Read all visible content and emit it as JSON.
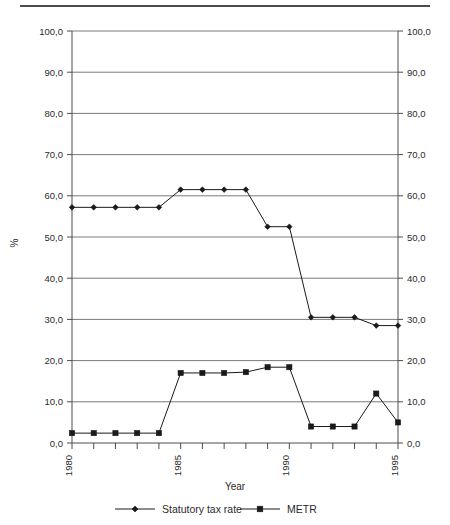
{
  "chart_data": {
    "type": "line",
    "title": "",
    "xlabel": "Year",
    "ylabel": "%",
    "x": [
      1980,
      1981,
      1982,
      1983,
      1984,
      1985,
      1986,
      1987,
      1988,
      1989,
      1990,
      1991,
      1992,
      1993,
      1994,
      1995
    ],
    "xlim": [
      1980,
      1995
    ],
    "ylim": [
      0,
      100
    ],
    "y_ticks": [
      0,
      10,
      20,
      30,
      40,
      50,
      60,
      70,
      80,
      90,
      100
    ],
    "y_tick_labels": [
      "0,0",
      "10,0",
      "20,0",
      "30,0",
      "40,0",
      "50,0",
      "60,0",
      "70,0",
      "80,0",
      "90,0",
      "100,0"
    ],
    "x_tick_labels_shown": [
      "1980",
      "1985",
      "1990",
      "1995"
    ],
    "x_tick_values_shown": [
      1980,
      1985,
      1990,
      1995
    ],
    "grid": "horizontal",
    "dual_y_axis": true,
    "right_axis_tick_labels": [
      "0,0",
      "10,0",
      "20,0",
      "30,0",
      "40,0",
      "50,0",
      "60,0",
      "70,0",
      "80,0",
      "90,0",
      "100,0"
    ],
    "legend_position": "bottom",
    "series": [
      {
        "name": "Statutory tax rate",
        "marker": "diamond",
        "values": [
          57.2,
          57.2,
          57.2,
          57.2,
          57.2,
          61.5,
          61.5,
          61.5,
          61.5,
          52.5,
          52.5,
          30.5,
          30.5,
          30.5,
          28.5,
          28.5
        ]
      },
      {
        "name": "METR",
        "marker": "square",
        "values": [
          2.4,
          2.4,
          2.4,
          2.4,
          2.4,
          17.0,
          17.0,
          17.0,
          17.2,
          18.4,
          18.4,
          4.0,
          4.0,
          4.0,
          12.0,
          5.0
        ]
      }
    ]
  },
  "legend": {
    "items": [
      {
        "label": "Statutory tax rate",
        "marker": "diamond"
      },
      {
        "label": "METR",
        "marker": "square"
      }
    ]
  },
  "axes": {
    "x_title": "Year",
    "y_title": "%"
  }
}
